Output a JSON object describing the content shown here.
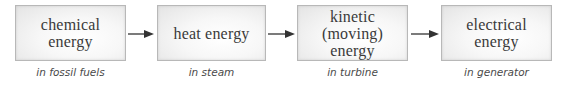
{
  "diagram": {
    "stages": [
      {
        "label": "chemical\nenergy",
        "caption": "in fossil fuels"
      },
      {
        "label": "heat energy",
        "caption": "in steam"
      },
      {
        "label": "kinetic\n(moving)\nenergy",
        "caption": "in turbine"
      },
      {
        "label": "electrical\nenergy",
        "caption": "in generator"
      }
    ],
    "arrows": [
      {
        "from": "chemical energy",
        "to": "heat energy",
        "icon": "right-arrow"
      },
      {
        "from": "heat energy",
        "to": "kinetic (moving) energy",
        "icon": "right-arrow"
      },
      {
        "from": "kinetic (moving) energy",
        "to": "electrical energy",
        "icon": "right-arrow"
      }
    ],
    "colors": {
      "box_border": "#b8b8b8",
      "box_fill_center": "#ffffff",
      "box_fill_edge": "#e4e4e4",
      "label_text": "#3a3a3a",
      "caption_text": "#4a4a4a",
      "arrow": "#333333"
    }
  }
}
